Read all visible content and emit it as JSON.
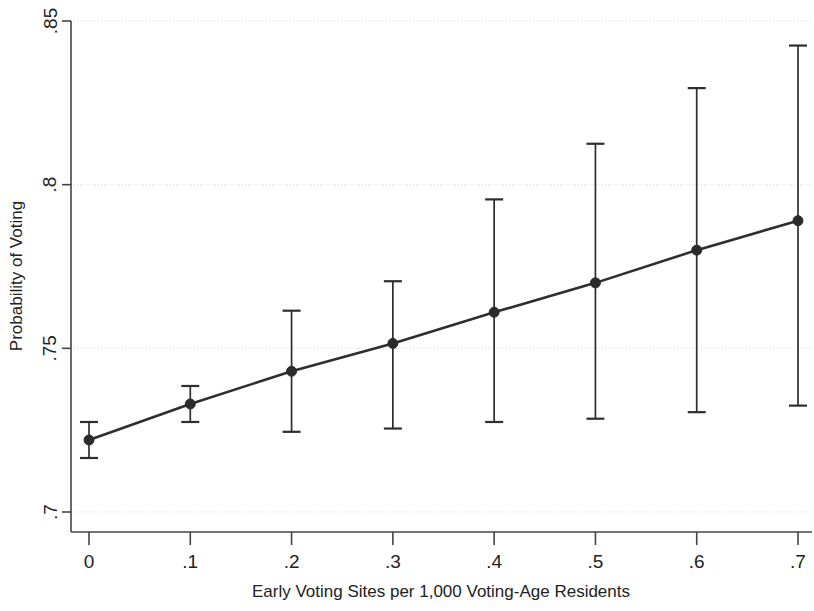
{
  "chart_data": {
    "type": "line",
    "title": "",
    "subtitle": "",
    "xlabel": "Early Voting Sites per 1,000 Voting-Age Residents",
    "ylabel": "Probability of Voting",
    "x": [
      0,
      0.1,
      0.2,
      0.3,
      0.4,
      0.5,
      0.6,
      0.7
    ],
    "xtick_labels": [
      "0",
      ".1",
      ".2",
      ".3",
      ".4",
      ".5",
      ".6",
      ".7"
    ],
    "ytick_labels": [
      ".85",
      ".8",
      ".75",
      ".7"
    ],
    "yticks": [
      0.85,
      0.8,
      0.75,
      0.7
    ],
    "xlim": [
      -0.02,
      0.72
    ],
    "ylim": [
      0.6875,
      0.855
    ],
    "grid": "horizontal-dotted",
    "legend": "none",
    "series": [
      {
        "name": "Predicted probability of voting",
        "values": [
          0.722,
          0.733,
          0.743,
          0.7515,
          0.761,
          0.77,
          0.78,
          0.789
        ],
        "ci_low": [
          0.7165,
          0.7275,
          0.7245,
          0.7255,
          0.7275,
          0.7285,
          0.7305,
          0.7325
        ],
        "ci_high": [
          0.7275,
          0.7385,
          0.7615,
          0.7705,
          0.7955,
          0.8125,
          0.8295,
          0.8425
        ],
        "marker": "filled-circle",
        "marker_size": 9,
        "color": "#2b2b2b",
        "error_bars": "95% confidence interval"
      }
    ],
    "colors": {
      "line": "#2b2b2b",
      "marker": "#2b2b2b",
      "error_bar": "#2e2e2e",
      "grid": "#d8d8d8",
      "axis": "#444444",
      "background": "#ffffff",
      "text": "#222222"
    }
  },
  "axes": {
    "x_axis_label": "Early Voting Sites per 1,000 Voting-Age Residents",
    "y_axis_label": "Probability of Voting"
  },
  "ticks": {
    "x": [
      {
        "label": "0",
        "value": 0
      },
      {
        "label": ".1",
        "value": 0.1
      },
      {
        "label": ".2",
        "value": 0.2
      },
      {
        "label": ".3",
        "value": 0.3
      },
      {
        "label": ".4",
        "value": 0.4
      },
      {
        "label": ".5",
        "value": 0.5
      },
      {
        "label": ".6",
        "value": 0.6
      },
      {
        "label": ".7",
        "value": 0.7
      }
    ],
    "y": [
      {
        "label": ".85",
        "value": 0.85
      },
      {
        "label": ".8",
        "value": 0.8
      },
      {
        "label": ".75",
        "value": 0.75
      },
      {
        "label": ".7",
        "value": 0.7
      }
    ]
  }
}
